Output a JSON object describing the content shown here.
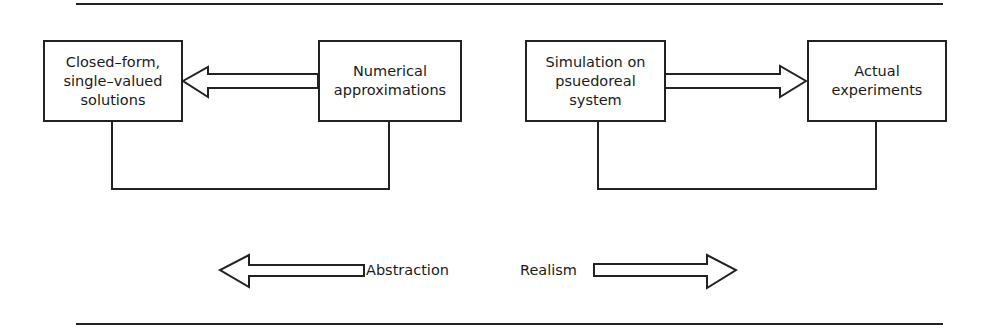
{
  "diagram": {
    "boxes": [
      {
        "id": "closed-form",
        "text": "Closed–form,\nsingle–valued\nsolutions"
      },
      {
        "id": "numerical",
        "text": "Numerical\napproximations"
      },
      {
        "id": "simulation",
        "text": "Simulation on\npsuedoreal\nsystem"
      },
      {
        "id": "experiments",
        "text": "Actual\nexperiments"
      }
    ],
    "arrows": [
      {
        "from": "numerical",
        "to": "closed-form",
        "style": "hollow-block"
      },
      {
        "from": "simulation",
        "to": "experiments",
        "style": "hollow-block"
      }
    ],
    "connectors": [
      {
        "between": [
          "closed-form",
          "numerical"
        ]
      },
      {
        "between": [
          "simulation",
          "experiments"
        ]
      }
    ],
    "axis": {
      "left_label": "Abstraction",
      "right_label": "Realism"
    }
  },
  "colors": {
    "stroke": "#222222",
    "background": "#ffffff"
  }
}
